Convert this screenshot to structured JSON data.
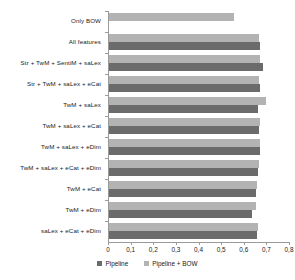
{
  "chart_data": {
    "type": "bar",
    "orientation": "horizontal",
    "title": "",
    "xlabel": "",
    "ylabel": "",
    "xlim": [
      0,
      0.8
    ],
    "xticks": [
      "0",
      "0,1",
      "0,2",
      "0,3",
      "0,4",
      "0,5",
      "0,6",
      "0,7",
      "0,8"
    ],
    "xtick_values": [
      0,
      0.1,
      0.2,
      0.3,
      0.4,
      0.5,
      0.6,
      0.7,
      0.8
    ],
    "grid": false,
    "legend_position": "bottom",
    "categories": [
      "Only BOW",
      "All features",
      "Str + TwM + SentiM + saLex",
      "Str + TwM + saLex + eCat",
      "TwM + saLex",
      "TwM + saLex + eCat",
      "TwM + saLex + eDim",
      "TwM + saLex + eCat + eDim",
      "TwM + eCat",
      "TwM + eDim",
      "saLex +  eCat + eDim"
    ],
    "series": [
      {
        "name": "Pipeline",
        "color": "#6b6b6b",
        "values": [
          null,
          0.672,
          0.685,
          0.673,
          0.662,
          0.668,
          0.67,
          0.664,
          0.652,
          0.638,
          0.66
        ]
      },
      {
        "name": "Pipeline + BOW",
        "color": "#b3b3b3",
        "values": [
          0.556,
          0.669,
          0.673,
          0.667,
          0.7,
          0.671,
          0.673,
          0.666,
          0.658,
          0.654,
          0.663
        ]
      }
    ]
  },
  "legend": {
    "items": [
      {
        "label": "Pipeline",
        "swatch": "dark"
      },
      {
        "label": "Pipeline + BOW",
        "swatch": "light"
      }
    ]
  }
}
